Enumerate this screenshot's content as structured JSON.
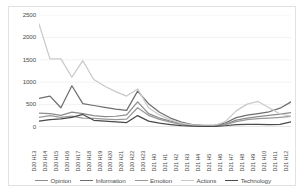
{
  "chart_data": {
    "type": "line",
    "title": "",
    "xlabel": "",
    "ylabel": "",
    "ylim": [
      0,
      2500
    ],
    "yticks": [
      0,
      500,
      1000,
      1500,
      2000,
      2500
    ],
    "grid": true,
    "legend_position": "bottom",
    "categories": [
      "D20 H13",
      "D20 H14",
      "D20 H15",
      "D20 H16",
      "D20 H17",
      "D20 H18",
      "D20 H19",
      "D20 H20",
      "D20 H21",
      "D20 H22",
      "D20 H23",
      "D21 H0",
      "D21 H1",
      "D21 H2",
      "D21 H3",
      "D21 H4",
      "D21 H5",
      "D21 H6",
      "D21 H7",
      "D21 H8",
      "D21 H9",
      "D21 H10",
      "D21 H11",
      "D21 H12"
    ],
    "series": [
      {
        "name": "Opinion",
        "color": "#8c8c8c",
        "values": [
          310,
          300,
          260,
          330,
          300,
          255,
          230,
          240,
          270,
          560,
          300,
          200,
          130,
          70,
          35,
          25,
          25,
          60,
          155,
          200,
          230,
          260,
          290,
          320
        ]
      },
      {
        "name": "Information",
        "color": "#6e6e6e",
        "values": [
          640,
          690,
          430,
          920,
          520,
          480,
          440,
          400,
          370,
          800,
          520,
          330,
          200,
          110,
          55,
          35,
          35,
          90,
          210,
          265,
          300,
          340,
          420,
          560
        ]
      },
      {
        "name": "Emotion",
        "color": "#999999",
        "values": [
          215,
          255,
          215,
          245,
          200,
          190,
          175,
          165,
          175,
          430,
          260,
          170,
          110,
          60,
          30,
          20,
          20,
          50,
          120,
          165,
          185,
          200,
          215,
          235
        ]
      },
      {
        "name": "Actions",
        "color": "#c9c9c9",
        "values": [
          2300,
          1520,
          1520,
          1110,
          1480,
          1060,
          910,
          790,
          690,
          850,
          430,
          270,
          160,
          85,
          45,
          30,
          30,
          120,
          360,
          510,
          570,
          430,
          290,
          240
        ]
      },
      {
        "name": "Technology",
        "color": "#4a4a4a",
        "values": [
          130,
          165,
          180,
          215,
          280,
          150,
          130,
          115,
          100,
          255,
          130,
          85,
          55,
          30,
          18,
          12,
          12,
          28,
          55,
          60,
          60,
          55,
          60,
          115
        ]
      }
    ]
  }
}
